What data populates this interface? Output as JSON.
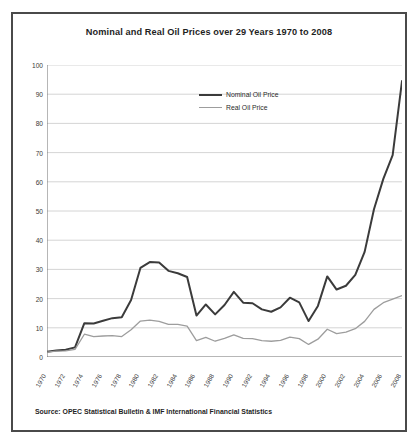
{
  "chart_data": {
    "type": "line",
    "title": "Nominal and Real Oil Prices over 29 Years 1970 to 2008",
    "xlabel": "",
    "ylabel": "",
    "ylim": [
      0,
      100
    ],
    "ytick_step": 10,
    "yticks": [
      "0",
      "10",
      "20",
      "30",
      "40",
      "50",
      "60",
      "70",
      "80",
      "90",
      "100"
    ],
    "grid": true,
    "legend_position": "top-center",
    "x": [
      1970,
      1971,
      1972,
      1973,
      1974,
      1975,
      1976,
      1977,
      1978,
      1979,
      1980,
      1981,
      1982,
      1983,
      1984,
      1985,
      1986,
      1987,
      1988,
      1989,
      1990,
      1991,
      1992,
      1993,
      1994,
      1995,
      1996,
      1997,
      1998,
      1999,
      2000,
      2001,
      2002,
      2003,
      2004,
      2005,
      2006,
      2007,
      2008
    ],
    "xticks": [
      "1970",
      "1972",
      "1974",
      "1976",
      "1978",
      "1980",
      "1982",
      "1984",
      "1986",
      "1988",
      "1990",
      "1992",
      "1994",
      "1996",
      "1998",
      "2000",
      "2002",
      "2004",
      "2006",
      "2008"
    ],
    "series": [
      {
        "name": "Nominal Oil Price",
        "color": "#3b3b3b",
        "width": 2.0,
        "values": [
          1.8,
          2.2,
          2.5,
          3.3,
          11.6,
          11.5,
          12.4,
          13.3,
          13.6,
          19.5,
          30.5,
          32.5,
          32.4,
          29.5,
          28.7,
          27.4,
          14.2,
          18.0,
          14.6,
          17.8,
          22.3,
          18.6,
          18.4,
          16.3,
          15.5,
          17.0,
          20.3,
          18.7,
          12.3,
          17.5,
          27.6,
          23.1,
          24.4,
          28.1,
          36.0,
          50.6,
          61.0,
          69.1,
          94.5
        ]
      },
      {
        "name": "Real Oil Price",
        "color": "#9d9d9d",
        "width": 1.3,
        "values": [
          1.7,
          2.0,
          2.1,
          2.6,
          7.8,
          7.0,
          7.2,
          7.3,
          7.0,
          9.3,
          12.3,
          12.6,
          12.2,
          11.2,
          11.2,
          10.6,
          5.6,
          6.7,
          5.4,
          6.4,
          7.6,
          6.4,
          6.3,
          5.6,
          5.4,
          5.7,
          6.8,
          6.3,
          4.3,
          6.1,
          9.5,
          8.0,
          8.5,
          9.7,
          12.2,
          16.3,
          18.6,
          19.8,
          21.0
        ]
      }
    ],
    "source_note": "Source: OPEC Statistical Bulletin & IMF International Financial Statistics"
  }
}
